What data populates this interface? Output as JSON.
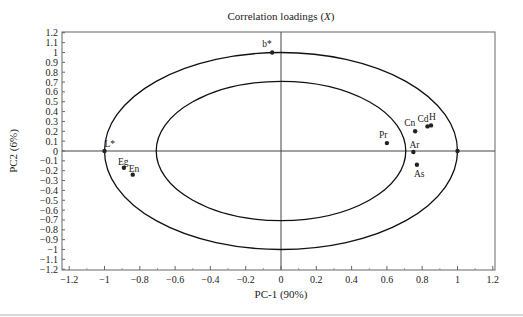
{
  "chart_data": {
    "type": "scatter",
    "title": "Correlation loadings (X)",
    "xlabel": "PC-1 (90%)",
    "ylabel": "PC2 (6%)",
    "xlim": [
      -1.2,
      1.2
    ],
    "ylim": [
      -1.2,
      1.2
    ],
    "x_ticks": [
      "-1.2",
      "-1",
      "-0.8",
      "-0.6",
      "-0.4",
      "-0.2",
      "0",
      "0.2",
      "0.4",
      "0.6",
      "0.8",
      "1",
      "1.2"
    ],
    "y_ticks": [
      "1.2",
      "1.1",
      "1",
      "0.9",
      "0.8",
      "0.7",
      "0.6",
      "0.5",
      "0.4",
      "0.3",
      "0.2",
      "0.1",
      "0",
      "-0.1",
      "-0.2",
      "-0.3",
      "-0.4",
      "-0.5",
      "-0.6",
      "-0.7",
      "-0.8",
      "-0.9",
      "-1",
      "-1.1",
      "-1.2"
    ],
    "grid": false,
    "ellipses": [
      {
        "name": "outer",
        "radius": 1.0
      },
      {
        "name": "inner",
        "radius": 0.707
      }
    ],
    "points": [
      {
        "label": "b*",
        "x": -0.05,
        "y": 1.0
      },
      {
        "label": "L*",
        "x": -1.0,
        "y": 0.0
      },
      {
        "label": "Eg",
        "x": -0.89,
        "y": -0.17
      },
      {
        "label": "En",
        "x": -0.84,
        "y": -0.24
      },
      {
        "label": "Pr",
        "x": 0.6,
        "y": 0.08
      },
      {
        "label": "Cn",
        "x": 0.76,
        "y": 0.2
      },
      {
        "label": "Cd",
        "x": 0.83,
        "y": 0.25
      },
      {
        "label": "H",
        "x": 0.85,
        "y": 0.26
      },
      {
        "label": "Ar",
        "x": 0.75,
        "y": -0.01
      },
      {
        "label": "As",
        "x": 0.77,
        "y": -0.14
      },
      {
        "label": "",
        "x": 1.0,
        "y": 0.0
      }
    ]
  }
}
